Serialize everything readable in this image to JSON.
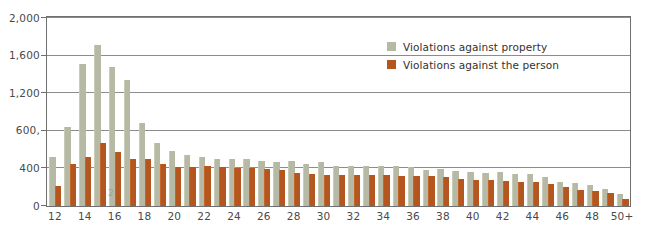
{
  "chart_data": {
    "type": "bar",
    "title": "",
    "subtitle": "",
    "xlabel": "",
    "ylabel": "",
    "ylim": [
      0,
      2000
    ],
    "grid": true,
    "grid_axis": "y",
    "legend_position": "top-center-right",
    "bar_mode": "grouped",
    "y_ticks": [
      0,
      400,
      800,
      1200,
      1600,
      2000
    ],
    "y_tick_labels": [
      "0",
      "400",
      "600,",
      "1,200",
      "1,600",
      "2,000"
    ],
    "x_tick_labels": [
      "12",
      "14",
      "16",
      "18",
      "20",
      "22",
      "24",
      "26",
      "28",
      "30",
      "32",
      "34",
      "36",
      "38",
      "40",
      "42",
      "44",
      "46",
      "48",
      "50+"
    ],
    "categories": [
      "12",
      "13",
      "14",
      "15",
      "16",
      "17",
      "18",
      "19",
      "20",
      "21",
      "22",
      "23",
      "24",
      "25",
      "26",
      "27",
      "28",
      "29",
      "30",
      "31",
      "32",
      "33",
      "34",
      "35",
      "36",
      "37",
      "38",
      "39",
      "40",
      "41",
      "42",
      "43",
      "44",
      "45",
      "46",
      "47",
      "48",
      "49",
      "50+"
    ],
    "series": [
      {
        "name": "Violations against property",
        "color": "#b6b9a4",
        "values": [
          520,
          830,
          1510,
          1710,
          1470,
          1340,
          880,
          660,
          575,
          540,
          520,
          500,
          490,
          500,
          470,
          465,
          470,
          440,
          460,
          420,
          425,
          420,
          425,
          420,
          415,
          375,
          385,
          370,
          360,
          345,
          355,
          340,
          330,
          300,
          255,
          235,
          215,
          180,
          120
        ]
      },
      {
        "name": "Violations against the person",
        "color": "#b5561e",
        "values": [
          205,
          440,
          520,
          665,
          565,
          500,
          490,
          440,
          415,
          415,
          420,
          405,
          400,
          395,
          385,
          380,
          350,
          330,
          325,
          320,
          320,
          320,
          320,
          315,
          310,
          310,
          305,
          280,
          275,
          270,
          265,
          255,
          250,
          225,
          195,
          165,
          150,
          130,
          65
        ]
      }
    ],
    "legend": [
      {
        "label": "Violations against property",
        "color": "#b6b9a4",
        "swatch": "property"
      },
      {
        "label": "Violations against the person",
        "color": "#b5561e",
        "swatch": "person"
      }
    ],
    "artifacts": {
      "page_number_bleed": "2"
    }
  }
}
